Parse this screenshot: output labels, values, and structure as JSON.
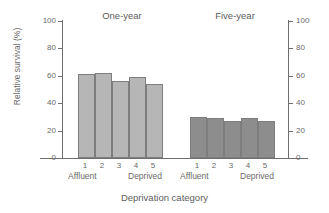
{
  "chart_data": {
    "type": "bar",
    "title": "",
    "xlabel": "Deprivation category",
    "ylabel": "Relative survival (%)",
    "ylim": [
      0,
      100
    ],
    "yticks": [
      0,
      20,
      40,
      60,
      80,
      100
    ],
    "ytick_labels": [
      "0",
      "20",
      "40",
      "60",
      "80",
      "100"
    ],
    "right_axis": {
      "ylim": [
        0,
        100
      ],
      "yticks": [
        0,
        20,
        40,
        60,
        80,
        100
      ],
      "ytick_labels": [
        "0",
        "20",
        "40",
        "60",
        "80",
        "100"
      ]
    },
    "grid": false,
    "legend": "none",
    "categories": [
      "1",
      "2",
      "3",
      "4",
      "5"
    ],
    "category_end_labels": {
      "low": "Affluent",
      "high": "Deprived"
    },
    "groups": [
      {
        "name": "One-year",
        "color": "#b6b6b6",
        "values": [
          61,
          62,
          56.5,
          59,
          54
        ]
      },
      {
        "name": "Five-year",
        "color": "#8d8d8d",
        "values": [
          30,
          29.5,
          27,
          29,
          27
        ]
      }
    ]
  },
  "axis_colors": {
    "axis_line": "#6f6f6f",
    "text": "#6a6a6a",
    "bar_outline": "#7d7d7d"
  }
}
